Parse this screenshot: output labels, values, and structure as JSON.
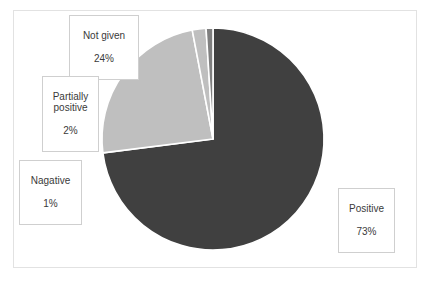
{
  "chart_data": {
    "type": "pie",
    "title": "",
    "xlabel": "",
    "ylabel": "",
    "legend_position": "none",
    "grid": false,
    "start_angle_deg": 0,
    "direction": "clockwise",
    "categories": [
      "Positive",
      "Not given",
      "Partially positive",
      "Nagative"
    ],
    "values": [
      73,
      24,
      2,
      1
    ],
    "unit": "%",
    "colors": [
      "#404040",
      "#bfbfbf",
      "#bfbfbf",
      "#7f7f7f"
    ],
    "slices": [
      {
        "label": "Positive",
        "value": 73,
        "display": "73%",
        "color": "#404040"
      },
      {
        "label": "Not given",
        "value": 24,
        "display": "24%",
        "color": "#bfbfbf"
      },
      {
        "label": "Partially positive",
        "value": 2,
        "display": "2%",
        "color": "#bfbfbf"
      },
      {
        "label": "Nagative",
        "value": 1,
        "display": "1%",
        "color": "#7f7f7f"
      }
    ],
    "data_labels": [
      {
        "name": "Not given",
        "line1": "Not given",
        "line2": "24%"
      },
      {
        "name": "Partially",
        "line1": "Partially",
        "line2": "positive",
        "line3": "2%"
      },
      {
        "name": "Nagative",
        "line1": "Nagative",
        "line2": "1%"
      },
      {
        "name": "Positive",
        "line1": "Positive",
        "line2": "73%"
      }
    ]
  },
  "labels": {
    "not_given": {
      "name": "Not given",
      "pct": "24%"
    },
    "partially": {
      "name": "Partially\npositive",
      "pct": "2%"
    },
    "nagative": {
      "name": "Nagative",
      "pct": "1%"
    },
    "positive": {
      "name": "Positive",
      "pct": "73%"
    }
  },
  "style": {
    "dark_gray": "#404040",
    "light_gray": "#bfbfbf",
    "mid_gray": "#7f7f7f",
    "frame_border": "#e2e2e2",
    "label_border": "#cfcfcf",
    "background": "#ffffff"
  }
}
